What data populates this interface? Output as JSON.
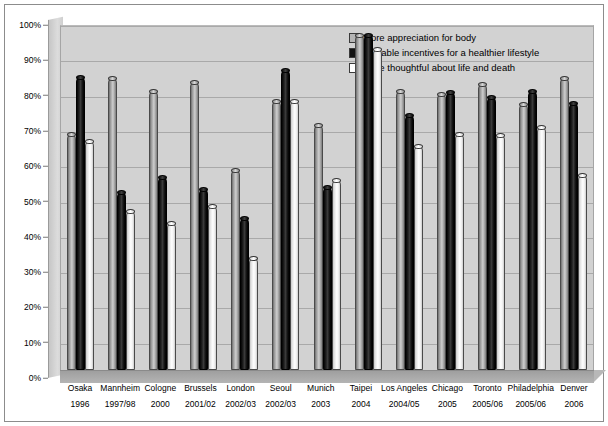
{
  "chart_data": {
    "type": "bar",
    "title": "",
    "xlabel": "",
    "ylabel": "",
    "ylim": [
      0,
      100
    ],
    "yticks": [
      "0%",
      "10%",
      "20%",
      "30%",
      "40%",
      "50%",
      "60%",
      "70%",
      "80%",
      "90%",
      "100%"
    ],
    "grid": true,
    "legend_position": "top-right",
    "categories": [
      "Osaka",
      "Mannheim",
      "Cologne",
      "Brussels",
      "London",
      "Seoul",
      "Munich",
      "Taipei",
      "Los Angeles",
      "Chicago",
      "Toronto",
      "Philadelphia",
      "Denver"
    ],
    "category_years": [
      "1996",
      "1997/98",
      "2000",
      "2001/02",
      "2002/03",
      "2002/03",
      "2003",
      "2004",
      "2004/05",
      "2005",
      "2005/06",
      "2005/06",
      "2006"
    ],
    "series": [
      {
        "name": "More appreciation for body",
        "color": "#b5b5b5",
        "values": [
          68.5,
          84.5,
          81,
          83.5,
          58,
          78,
          71,
          97,
          81,
          80,
          83,
          77,
          84.5
        ]
      },
      {
        "name": "Valuable incentives for a healthier lifestyle",
        "color": "#111111",
        "values": [
          85,
          51.5,
          56,
          52.5,
          44,
          87,
          53,
          97,
          74,
          80.5,
          79,
          81,
          77.5
        ]
      },
      {
        "name": "More thoughtful about life and death",
        "color": "#ffffff",
        "values": [
          66.5,
          46,
          42.5,
          47.5,
          32.5,
          78,
          55,
          93,
          65,
          68.5,
          68,
          70.5,
          56.5
        ]
      }
    ]
  },
  "legend": {
    "items": [
      {
        "label": "More appreciation for body",
        "swatch": "gray"
      },
      {
        "label": "Valuable incentives for a healthier lifestyle",
        "swatch": "black"
      },
      {
        "label": "More thoughtful about life and death",
        "swatch": "white"
      }
    ]
  }
}
